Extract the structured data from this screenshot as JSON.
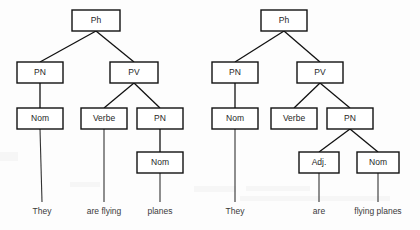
{
  "figure": {
    "kind": "syntax-tree-pair",
    "background_color": "#fdfdfd",
    "box_border_color": "#111111",
    "box_fill_color": "#ffffff",
    "text_color": "#262626",
    "edge_color": "#111111",
    "leaf_text_color": "#3a3a3a"
  },
  "trees": [
    {
      "id": "tree-left",
      "name": "parse-tree-left",
      "reading": "They are flying planes",
      "nodes": [
        {
          "id": "L-ph",
          "label": "Ph",
          "x": 72,
          "y": 10,
          "w": 48,
          "h": 21
        },
        {
          "id": "L-pn1",
          "label": "PN",
          "x": 17,
          "y": 62,
          "w": 46,
          "h": 21
        },
        {
          "id": "L-pv",
          "label": "PV",
          "x": 110,
          "y": 62,
          "w": 48,
          "h": 21
        },
        {
          "id": "L-nom1",
          "label": "Nom",
          "x": 17,
          "y": 108,
          "w": 46,
          "h": 21
        },
        {
          "id": "L-verbe",
          "label": "Verbe",
          "x": 81,
          "y": 108,
          "w": 46,
          "h": 21
        },
        {
          "id": "L-pn2",
          "label": "PN",
          "x": 137,
          "y": 108,
          "w": 46,
          "h": 21
        },
        {
          "id": "L-nom2",
          "label": "Nom",
          "x": 137,
          "y": 152,
          "w": 46,
          "h": 21
        }
      ],
      "edges": [
        {
          "from": "L-ph",
          "to": "L-pn1"
        },
        {
          "from": "L-ph",
          "to": "L-pv"
        },
        {
          "from": "L-pn1",
          "to": "L-nom1"
        },
        {
          "from": "L-pv",
          "to": "L-verbe"
        },
        {
          "from": "L-pv",
          "to": "L-pn2"
        },
        {
          "from": "L-pn2",
          "to": "L-nom2"
        }
      ],
      "leaves": [
        {
          "id": "L-leaf-they",
          "text": "They",
          "from": "L-nom1",
          "x": 42,
          "y": 212
        },
        {
          "id": "L-leaf-flying",
          "text": "are flying",
          "from": "L-verbe",
          "x": 104,
          "y": 212
        },
        {
          "id": "L-leaf-planes",
          "text": "planes",
          "from": "L-nom2",
          "x": 160,
          "y": 212
        }
      ]
    },
    {
      "id": "tree-right",
      "name": "parse-tree-right",
      "reading": "They are flying planes",
      "nodes": [
        {
          "id": "R-ph",
          "label": "Ph",
          "x": 261,
          "y": 10,
          "w": 46,
          "h": 21
        },
        {
          "id": "R-pn1",
          "label": "PN",
          "x": 212,
          "y": 62,
          "w": 46,
          "h": 21
        },
        {
          "id": "R-pv",
          "label": "PV",
          "x": 297,
          "y": 62,
          "w": 46,
          "h": 21
        },
        {
          "id": "R-nom1",
          "label": "Nom",
          "x": 212,
          "y": 108,
          "w": 46,
          "h": 21
        },
        {
          "id": "R-verbe",
          "label": "Verbe",
          "x": 271,
          "y": 108,
          "w": 46,
          "h": 21
        },
        {
          "id": "R-pn2",
          "label": "PN",
          "x": 327,
          "y": 108,
          "w": 46,
          "h": 21
        },
        {
          "id": "R-adj",
          "label": "Adj.",
          "x": 299,
          "y": 152,
          "w": 40,
          "h": 21
        },
        {
          "id": "R-nom2",
          "label": "Nom",
          "x": 357,
          "y": 152,
          "w": 42,
          "h": 21
        }
      ],
      "edges": [
        {
          "from": "R-ph",
          "to": "R-pn1"
        },
        {
          "from": "R-ph",
          "to": "R-pv"
        },
        {
          "from": "R-pn1",
          "to": "R-nom1"
        },
        {
          "from": "R-pv",
          "to": "R-verbe"
        },
        {
          "from": "R-pv",
          "to": "R-pn2"
        },
        {
          "from": "R-pn2",
          "to": "R-adj"
        },
        {
          "from": "R-pn2",
          "to": "R-nom2"
        }
      ],
      "leaves": [
        {
          "id": "R-leaf-they",
          "text": "They",
          "from": "R-nom1",
          "x": 235,
          "y": 212
        },
        {
          "id": "R-leaf-are",
          "text": "are",
          "from": "R-adj",
          "x": 319,
          "y": 212
        },
        {
          "id": "R-leaf-flying",
          "text": "flying planes",
          "from": "R-nom2",
          "x": 378,
          "y": 212
        }
      ]
    }
  ]
}
